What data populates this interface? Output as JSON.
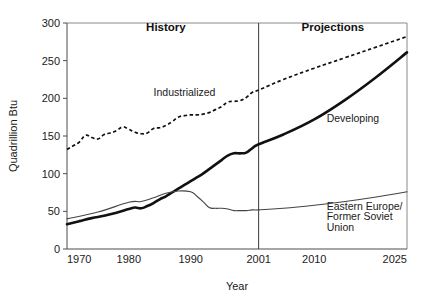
{
  "chart_data": {
    "type": "line",
    "title": "",
    "xlabel": "Year",
    "ylabel": "Quadrillion Btu",
    "xlim": [
      1970,
      2025
    ],
    "ylim": [
      0,
      300
    ],
    "xticks": [
      1970,
      1980,
      1990,
      2001,
      2010,
      2025
    ],
    "xticklabels": [
      "1970",
      "1980",
      "1990",
      "2001",
      "2010",
      "2025"
    ],
    "yticks": [
      0,
      50,
      100,
      150,
      200,
      250,
      300
    ],
    "yticklabels": [
      "0",
      "50",
      "100",
      "150",
      "200",
      "250",
      "300"
    ],
    "grid": false,
    "legend_position": "inline-annotations",
    "annotations": [
      {
        "text": "History",
        "x": 1986,
        "y": 290,
        "style": "bold"
      },
      {
        "text": "Projections",
        "x": 2013,
        "y": 290,
        "style": "bold"
      },
      {
        "text": "Industrialized",
        "x": 1984,
        "y": 203,
        "style": "plain"
      },
      {
        "text": "Developing",
        "x": 2012,
        "y": 168,
        "style": "plain"
      },
      {
        "text": "Eastern Europe/",
        "x": 2012,
        "y": 52,
        "style": "plain"
      },
      {
        "text": "Former Soviet",
        "x": 2012,
        "y": 38,
        "style": "plain"
      },
      {
        "text": "Union",
        "x": 2012,
        "y": 24,
        "style": "plain"
      }
    ],
    "divider": {
      "x": 2001,
      "label_left": "History",
      "label_right": "Projections"
    },
    "series": [
      {
        "name": "Industrialized",
        "style": "dashed",
        "x": [
          1970,
          1971,
          1972,
          1973,
          1974,
          1975,
          1976,
          1977,
          1978,
          1979,
          1980,
          1981,
          1982,
          1983,
          1984,
          1985,
          1986,
          1987,
          1988,
          1989,
          1990,
          1991,
          1992,
          1993,
          1994,
          1995,
          1996,
          1997,
          1998,
          1999,
          2000,
          2001,
          2005,
          2010,
          2015,
          2020,
          2025
        ],
        "values": [
          132,
          137,
          142,
          151,
          148,
          146,
          152,
          154,
          157,
          162,
          159,
          155,
          153,
          154,
          160,
          161,
          164,
          169,
          175,
          177,
          178,
          178,
          179,
          181,
          185,
          189,
          195,
          196,
          197,
          201,
          208,
          211,
          225,
          240,
          254,
          268,
          282
        ]
      },
      {
        "name": "Developing",
        "style": "solid-thick",
        "x": [
          1970,
          1972,
          1974,
          1976,
          1978,
          1980,
          1981,
          1982,
          1983,
          1984,
          1985,
          1986,
          1987,
          1988,
          1989,
          1990,
          1991,
          1992,
          1993,
          1994,
          1995,
          1996,
          1997,
          1998,
          1999,
          2000,
          2001,
          2005,
          2010,
          2015,
          2020,
          2025
        ],
        "values": [
          33,
          37,
          41,
          44,
          48,
          53,
          55,
          54,
          57,
          61,
          66,
          70,
          75,
          80,
          85,
          90,
          95,
          100,
          106,
          112,
          118,
          124,
          127,
          127,
          128,
          134,
          139,
          152,
          172,
          198,
          228,
          261
        ]
      },
      {
        "name": "Eastern Europe/Former Soviet Union",
        "style": "solid-thin",
        "x": [
          1970,
          1975,
          1980,
          1982,
          1984,
          1986,
          1988,
          1990,
          1991,
          1992,
          1993,
          1994,
          1995,
          1996,
          1997,
          1998,
          1999,
          2000,
          2001,
          2005,
          2010,
          2015,
          2020,
          2025
        ],
        "values": [
          40,
          49,
          62,
          63,
          68,
          74,
          77,
          76,
          70,
          63,
          55,
          54,
          54,
          53,
          51,
          51,
          51,
          52,
          52,
          54,
          58,
          63,
          69,
          76
        ]
      }
    ]
  },
  "geometry": {
    "plot_left": 67,
    "plot_right": 407,
    "plot_top": 23,
    "plot_bottom": 249
  }
}
